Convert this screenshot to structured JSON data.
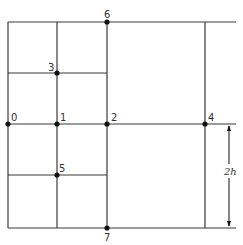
{
  "diagram": {
    "type": "finite-difference-grid",
    "nodes": [
      {
        "id": "0",
        "label": "0"
      },
      {
        "id": "1",
        "label": "1"
      },
      {
        "id": "2",
        "label": "2"
      },
      {
        "id": "3",
        "label": "3"
      },
      {
        "id": "4",
        "label": "4"
      },
      {
        "id": "5",
        "label": "5"
      },
      {
        "id": "6",
        "label": "6"
      },
      {
        "id": "7",
        "label": "7"
      }
    ],
    "dimension_label": "2h"
  }
}
